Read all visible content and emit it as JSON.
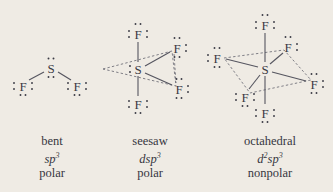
{
  "figure": {
    "background_color": "#efebe4",
    "ink_color": "#3a3a44",
    "bond_color": "#55555f",
    "guide_color": "#6a6a74"
  },
  "structures": [
    {
      "id": "bent",
      "central_atom": "S",
      "ligand_atom": "F",
      "ligand_count": 2,
      "central_lone_pairs": 2,
      "ligand_lone_pairs": 3,
      "bond_style": "solid",
      "caption": {
        "geometry": "bent",
        "hybridization_base": "sp",
        "hybridization_exp": "3",
        "polarity": "polar"
      }
    },
    {
      "id": "seesaw",
      "central_atom": "S",
      "ligand_atom": "F",
      "ligand_count": 4,
      "central_lone_pairs": 1,
      "ligand_lone_pairs": 3,
      "bond_style": "solid-with-dashed-guides",
      "caption": {
        "geometry": "seesaw",
        "hybridization_base": "dsp",
        "hybridization_exp": "3",
        "polarity": "polar"
      }
    },
    {
      "id": "octahedral",
      "central_atom": "S",
      "ligand_atom": "F",
      "ligand_count": 6,
      "central_lone_pairs": 0,
      "ligand_lone_pairs": 3,
      "bond_style": "solid-with-dashed-guides",
      "caption": {
        "geometry": "octahedral",
        "hybridization_base": "d",
        "hybridization_exp1": "2",
        "hybridization_base2": "sp",
        "hybridization_exp2": "3",
        "polarity": "nonpolar"
      }
    }
  ],
  "atoms": {
    "sulfur": "S",
    "fluorine": "F"
  }
}
